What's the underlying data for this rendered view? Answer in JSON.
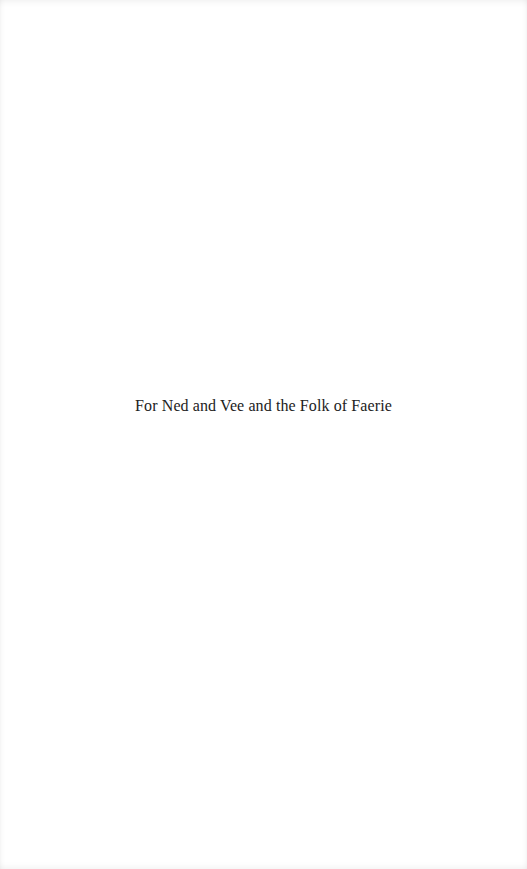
{
  "page": {
    "background": "#ffffff",
    "dedication": "For Ned and Vee and the Folk of Faerie"
  }
}
